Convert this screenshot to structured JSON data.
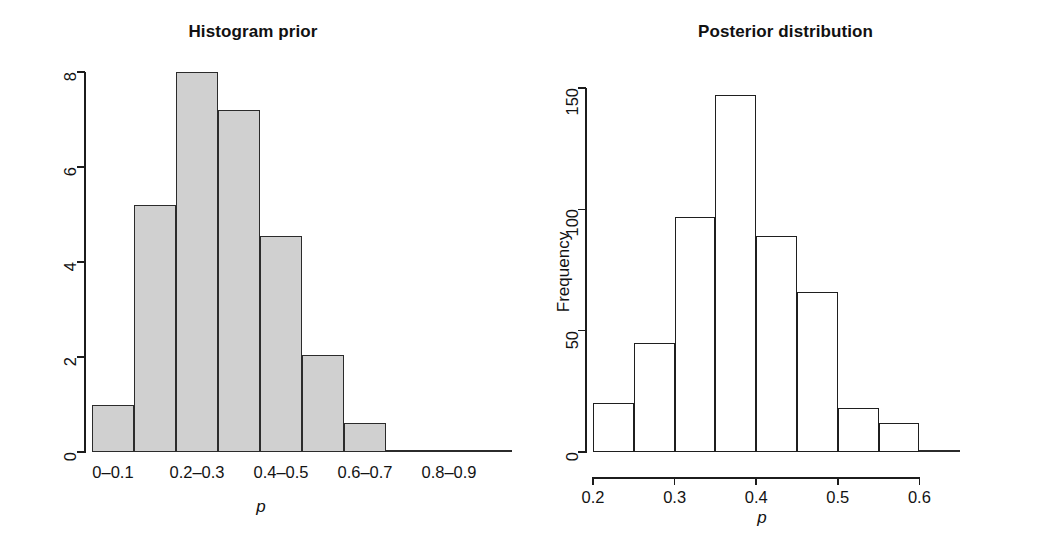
{
  "figure": {
    "background": "#ffffff",
    "width": 1045,
    "height": 549
  },
  "panels": [
    {
      "id": "histogram-prior",
      "title": "Histogram prior",
      "xlabel": "p",
      "ylabel": ""
    },
    {
      "id": "posterior-distribution",
      "title": "Posterior distribution",
      "xlabel": "p",
      "ylabel": "Frequency"
    }
  ],
  "chart_data": [
    {
      "type": "bar",
      "id": "histogram-prior",
      "title": "Histogram prior",
      "xlabel": "p",
      "ylabel": "",
      "bar_style": "grey-filled",
      "bar_fill_color": "#d0d0d0",
      "bar_edge_color": "#2b2b2b",
      "grid": false,
      "legend": "none",
      "ylim": [
        0,
        8
      ],
      "ytick_labels": [
        "0",
        "2",
        "4",
        "6",
        "8"
      ],
      "ytick_values": [
        0,
        2,
        4,
        6,
        8
      ],
      "xlim": [
        0,
        1
      ],
      "xtick_labels": [
        "0–0.1",
        "0.2–0.3",
        "0.4–0.5",
        "0.6–0.7",
        "0.8–0.9"
      ],
      "xtick_bin_index": [
        0,
        2,
        4,
        6,
        8
      ],
      "categories": [
        "0–0.1",
        "0.1–0.2",
        "0.2–0.3",
        "0.3–0.4",
        "0.4–0.5",
        "0.5–0.6",
        "0.6–0.7",
        "0.7–0.8",
        "0.8–0.9",
        "0.9–1"
      ],
      "values": [
        1.0,
        5.2,
        8.0,
        7.2,
        4.55,
        2.05,
        0.62,
        0.05,
        0.0,
        0.0
      ]
    },
    {
      "type": "bar",
      "id": "posterior-distribution",
      "title": "Posterior distribution",
      "xlabel": "p",
      "ylabel": "Frequency",
      "bar_style": "open-outline",
      "bar_fill_color": "#ffffff",
      "bar_edge_color": "#1f1f1f",
      "grid": false,
      "legend": "none",
      "ylim": [
        0,
        150
      ],
      "ytick_labels": [
        "0",
        "50",
        "100",
        "150"
      ],
      "ytick_values": [
        0,
        50,
        100,
        150
      ],
      "xlim": [
        0.2,
        0.65
      ],
      "xtick_labels": [
        "0.2",
        "0.3",
        "0.4",
        "0.5",
        "0.6"
      ],
      "xtick_values": [
        0.2,
        0.3,
        0.4,
        0.5,
        0.6
      ],
      "bin_edges": [
        0.2,
        0.25,
        0.3,
        0.35,
        0.4,
        0.45,
        0.5,
        0.55,
        0.6,
        0.65
      ],
      "categories": [
        "0.20–0.25",
        "0.25–0.30",
        "0.30–0.35",
        "0.35–0.40",
        "0.40–0.45",
        "0.45–0.50",
        "0.50–0.55",
        "0.55–0.60",
        "0.60–0.65"
      ],
      "values": [
        20,
        45,
        97,
        147,
        89,
        66,
        18,
        12,
        1
      ]
    }
  ]
}
